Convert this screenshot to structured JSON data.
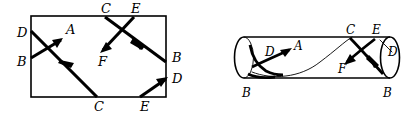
{
  "figure": {
    "background_color": "#ffffff",
    "ink_color": "#000000",
    "width": 412,
    "height": 114
  },
  "left_diagram": {
    "name": "unrolled-rectangle",
    "shape": "rectangle",
    "rect": {
      "x": 31,
      "y": 16,
      "width": 135,
      "height": 81
    },
    "labels": [
      {
        "id": "left-D",
        "text": "D",
        "x": 17,
        "y": 37
      },
      {
        "id": "left-B",
        "text": "B",
        "x": 17,
        "y": 66
      },
      {
        "id": "left-A",
        "text": "A",
        "x": 66,
        "y": 34
      },
      {
        "id": "top-C",
        "text": "C",
        "x": 101,
        "y": 13
      },
      {
        "id": "top-E",
        "text": "E",
        "x": 131,
        "y": 13
      },
      {
        "id": "inner-F",
        "text": "F",
        "x": 98,
        "y": 62
      },
      {
        "id": "right-B",
        "text": "B",
        "x": 172,
        "y": 62
      },
      {
        "id": "right-D",
        "text": "D",
        "x": 172,
        "y": 82
      },
      {
        "id": "bottom-C",
        "text": "C",
        "x": 94,
        "y": 110
      },
      {
        "id": "bottom-E",
        "text": "E",
        "x": 140,
        "y": 110
      }
    ]
  },
  "right_diagram": {
    "name": "cylinder",
    "shape": "cylinder",
    "body": {
      "left_x": 244,
      "right_x": 390,
      "top_y": 37,
      "bottom_y": 78
    },
    "left_cap": {
      "cx": 244,
      "cy": 57.5,
      "rx": 9,
      "ry": 20.5
    },
    "right_cap": {
      "cx": 390,
      "cy": 57.5,
      "rx": 9,
      "ry": 20.5
    },
    "labels": [
      {
        "id": "cyl-D-left",
        "text": "D",
        "x": 267,
        "y": 53
      },
      {
        "id": "cyl-A",
        "text": "A",
        "x": 297,
        "y": 51
      },
      {
        "id": "cyl-C",
        "text": "C",
        "x": 348,
        "y": 35
      },
      {
        "id": "cyl-E",
        "text": "E",
        "x": 372,
        "y": 35
      },
      {
        "id": "cyl-D-right",
        "text": "D",
        "x": 389,
        "y": 55
      },
      {
        "id": "cyl-F",
        "text": "F",
        "x": 341,
        "y": 70
      },
      {
        "id": "cyl-B-left",
        "text": "B",
        "x": 245,
        "y": 96
      },
      {
        "id": "cyl-B-right",
        "text": "B",
        "x": 385,
        "y": 96
      }
    ]
  }
}
